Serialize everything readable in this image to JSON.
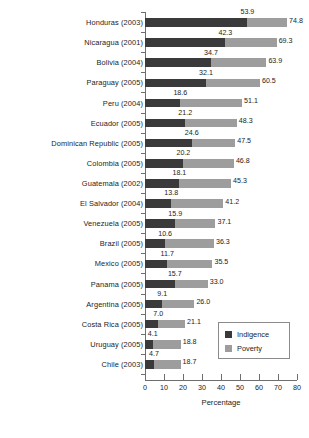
{
  "chart_data": {
    "type": "bar",
    "orientation": "horizontal",
    "stacked_overlay": true,
    "title": "",
    "xlabel": "Percentage",
    "ylabel": "",
    "xlim": [
      0,
      80
    ],
    "xticks": [
      0,
      10,
      20,
      30,
      40,
      50,
      60,
      70,
      80
    ],
    "grid": false,
    "legend_position": "lower right",
    "categories": [
      "Honduras (2003)",
      "Nicaragua (2001)",
      "Bolivia (2004)",
      "Paraguay (2005)",
      "Peru (2004)",
      "Ecuador (2005)",
      "Dominican Republic (2005)",
      "Colombia (2005)",
      "Guatemala (2002)",
      "El Salvador (2004)",
      "Venezuela (2005)",
      "Brazil (2005)",
      "Mexico (2005)",
      "Panama (2005)",
      "Argentina (2005)",
      "Costa Rica (2005)",
      "Uruguay (2005)",
      "Chile (2003)"
    ],
    "series": [
      {
        "name": "Indigence",
        "color": "#3a3a3a",
        "values": [
          53.9,
          42.3,
          34.7,
          32.1,
          18.6,
          21.2,
          24.6,
          20.2,
          18.1,
          13.8,
          15.9,
          10.6,
          11.7,
          15.7,
          9.1,
          7.0,
          4.1,
          4.7
        ]
      },
      {
        "name": "Poverty",
        "color": "#9d9d9d",
        "values": [
          74.8,
          69.3,
          63.9,
          60.5,
          51.1,
          48.3,
          47.5,
          46.8,
          45.3,
          41.2,
          37.1,
          36.3,
          35.5,
          33.0,
          26.0,
          21.1,
          18.8,
          18.7
        ]
      }
    ],
    "value_labels_poverty": [
      "74.8",
      "69.3",
      "63.9",
      "60.5",
      "51.1",
      "48.3",
      "47.5",
      "46.8",
      "45.3",
      "41.2",
      "37.1",
      "36.3",
      "35.5",
      "33.0",
      "26.0",
      "21.1",
      "18.8",
      "18.7"
    ],
    "value_labels_indigence": [
      "53.9",
      "42.3",
      "34.7",
      "32.1",
      "18.6",
      "21.2",
      "24.6",
      "20.2",
      "18.1",
      "13.8",
      "15.9",
      "10.6",
      "11.7",
      "15.7",
      "9.1",
      "7.0",
      "4.1",
      "4.7"
    ],
    "legend": [
      {
        "label": "Indigence",
        "color": "#3a3a3a"
      },
      {
        "label": "Poverty",
        "color": "#9d9d9d"
      }
    ]
  }
}
